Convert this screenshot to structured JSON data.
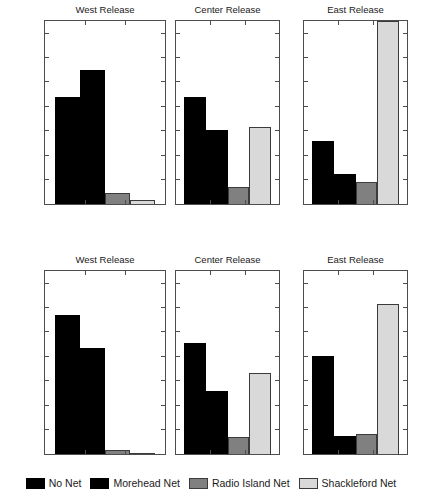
{
  "chart_data": [
    {
      "type": "bar",
      "title": "West Release",
      "panel_row": "top",
      "categories": [
        "No Net",
        "Morehead Net",
        "Radio Island Net",
        "Shackleford Net"
      ],
      "values": [
        44,
        55,
        4.5,
        1.5
      ],
      "xlabel": "",
      "ylabel": "Percent of total drogues",
      "ylim": [
        0,
        75
      ],
      "yticks": [
        0,
        10,
        20,
        30,
        40,
        50,
        60,
        70
      ],
      "grid": false
    },
    {
      "type": "bar",
      "title": "Center Release",
      "panel_row": "top",
      "categories": [
        "No Net",
        "Morehead Net",
        "Radio Island Net",
        "Shackleford Net"
      ],
      "values": [
        44,
        30.5,
        7,
        31.5
      ],
      "xlabel": "",
      "ylabel": "",
      "ylim": [
        0,
        75
      ],
      "yticks": [
        0,
        10,
        20,
        30,
        40,
        50,
        60,
        70
      ],
      "grid": false
    },
    {
      "type": "bar",
      "title": "East Release",
      "panel_row": "top",
      "categories": [
        "No Net",
        "Morehead Net",
        "Radio Island Net",
        "Shackleford Net"
      ],
      "values": [
        26,
        12.5,
        9,
        75
      ],
      "xlabel": "",
      "ylabel": "",
      "ylim": [
        0,
        75
      ],
      "yticks": [
        0,
        10,
        20,
        30,
        40,
        50,
        60,
        70
      ],
      "grid": false
    },
    {
      "type": "bar",
      "title": "West Release",
      "panel_row": "bottom",
      "categories": [
        "No Net",
        "Morehead Net",
        "Radio Island Net",
        "Shackleford Net"
      ],
      "values": [
        57,
        43.5,
        1.5,
        0
      ],
      "xlabel": "",
      "ylabel": "Percent of total drogues",
      "ylim": [
        0,
        75
      ],
      "yticks": [
        0,
        10,
        20,
        30,
        40,
        50,
        60,
        70
      ],
      "grid": false
    },
    {
      "type": "bar",
      "title": "Center Release",
      "panel_row": "bottom",
      "categories": [
        "No Net",
        "Morehead Net",
        "Radio Island Net",
        "Shackleford Net"
      ],
      "values": [
        45.5,
        26,
        6.8,
        33
      ],
      "xlabel": "",
      "ylabel": "",
      "ylim": [
        0,
        75
      ],
      "yticks": [
        0,
        10,
        20,
        30,
        40,
        50,
        60,
        70
      ],
      "grid": false
    },
    {
      "type": "bar",
      "title": "East Release",
      "panel_row": "bottom",
      "categories": [
        "No Net",
        "Morehead Net",
        "Radio Island Net",
        "Shackleford Net"
      ],
      "values": [
        40,
        7.3,
        8,
        61.3
      ],
      "xlabel": "",
      "ylabel": "",
      "ylim": [
        0,
        75
      ],
      "yticks": [
        0,
        10,
        20,
        30,
        40,
        50,
        60,
        70
      ],
      "grid": false
    }
  ],
  "axis": {
    "ylabel": "Percent of total drogues",
    "yticks": [
      70,
      60,
      50,
      40,
      30,
      20,
      10,
      0
    ],
    "ymin": 0,
    "ymax": 75
  },
  "legend": {
    "position": "bottom-center",
    "items": [
      {
        "label": "No Net",
        "color": "#000000"
      },
      {
        "label": "Morehead Net",
        "color": "#000000"
      },
      {
        "label": "Radio Island Net",
        "color": "#808080"
      },
      {
        "label": "Shackleford Net",
        "color": "#d9d9d9"
      }
    ]
  },
  "titles": {
    "top": [
      "West Release",
      "Center Release",
      "East Release"
    ],
    "bottom": [
      "West Release",
      "Center Release",
      "East Release"
    ]
  }
}
